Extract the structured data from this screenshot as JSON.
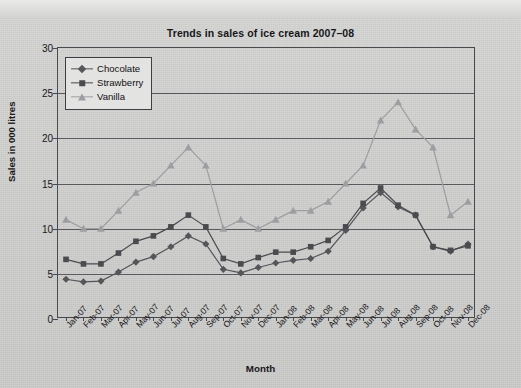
{
  "chart_data": {
    "type": "line",
    "title": "Trends in sales of ice cream 2007–08",
    "xlabel": "Month",
    "ylabel": "Sales in 000 litres",
    "ylim": [
      0,
      30
    ],
    "yticks": [
      0,
      5,
      10,
      15,
      20,
      25,
      30
    ],
    "grid": true,
    "legend_position": "top-left",
    "categories": [
      "Jan-07",
      "Feb-07",
      "Mar-07",
      "Apr-07",
      "May-07",
      "Jun-07",
      "Jul-07",
      "Aug-07",
      "Sep-07",
      "Oct-07",
      "Nov-07",
      "Dec-07",
      "Jan-08",
      "Feb-08",
      "Mar-08",
      "Apr-08",
      "May-08",
      "Jun-08",
      "Jul-08",
      "Aug-08",
      "Sep-08",
      "Oct-08",
      "Nov-08",
      "Dec-08"
    ],
    "series": [
      {
        "name": "Chocolate",
        "marker": "diamond",
        "color": "#55555a",
        "values": [
          4.4,
          4.1,
          4.2,
          5.2,
          6.3,
          6.9,
          8.0,
          9.2,
          8.3,
          5.5,
          5.1,
          5.7,
          6.2,
          6.5,
          6.7,
          7.5,
          9.8,
          12.3,
          14.0,
          12.4,
          11.5,
          8.0,
          7.5,
          8.3
        ]
      },
      {
        "name": "Strawberry",
        "marker": "square",
        "color": "#4a4a4f",
        "values": [
          6.6,
          6.1,
          6.1,
          7.3,
          8.6,
          9.2,
          10.2,
          11.5,
          10.2,
          6.7,
          6.1,
          6.8,
          7.4,
          7.4,
          8.0,
          8.7,
          10.2,
          12.8,
          14.5,
          12.6,
          11.5,
          8.0,
          7.6,
          8.1
        ]
      },
      {
        "name": "Vanilla",
        "marker": "triangle",
        "color": "#9d9da2",
        "values": [
          11.0,
          10.0,
          10.0,
          12.0,
          14.0,
          15.0,
          17.0,
          19.0,
          17.0,
          10.0,
          11.0,
          10.0,
          11.0,
          12.0,
          12.0,
          13.0,
          15.0,
          17.0,
          22.0,
          24.0,
          21.0,
          19.0,
          11.5,
          13.0
        ]
      }
    ]
  }
}
